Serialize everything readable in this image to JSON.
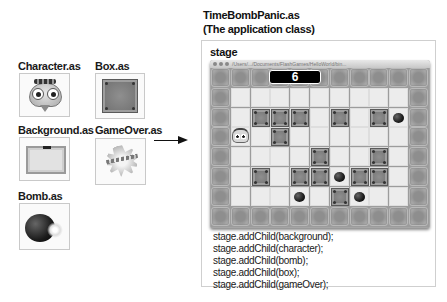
{
  "assets": [
    {
      "label": "Character.as",
      "icon": "character-icon"
    },
    {
      "label": "Box.as",
      "icon": "box-icon"
    },
    {
      "label": "Background.as",
      "icon": "background-icon"
    },
    {
      "label": "GameOver.as",
      "icon": "game-over-icon"
    },
    {
      "label": "Bomb.as",
      "icon": "bomb-icon"
    }
  ],
  "app": {
    "title_line1": "TimeBombPanic.as",
    "title_line2": "(The application class)",
    "stage_label": "stage"
  },
  "game_window": {
    "titlebar_path": "/Users/.../Documents/FlashGames/HelloWorld/bin...",
    "timer_value": "6",
    "grid": {
      "columns": 11,
      "rows": 8,
      "inner_columns": 9,
      "inner_rows": 6,
      "boxes": [
        [
          1,
          1
        ],
        [
          2,
          1
        ],
        [
          3,
          1
        ],
        [
          5,
          1
        ],
        [
          7,
          1
        ],
        [
          2,
          2
        ],
        [
          4,
          3
        ],
        [
          7,
          3
        ],
        [
          1,
          4
        ],
        [
          3,
          4
        ],
        [
          4,
          4
        ],
        [
          6,
          4
        ],
        [
          7,
          4
        ],
        [
          5,
          5
        ]
      ],
      "bombs": [
        [
          8,
          1
        ],
        [
          5,
          4
        ],
        [
          3,
          5
        ],
        [
          6,
          5
        ]
      ],
      "character": [
        0,
        2
      ]
    }
  },
  "code_lines": [
    "stage.addChild(background);",
    "stage.addChild(character);",
    "stage.addChild(bomb);",
    "stage.addChild(box);",
    "stage.addChild(gameOver);"
  ],
  "colors": {
    "wall": "#9c9c9c",
    "floor": "#ececec",
    "box": "#7f7f7f",
    "timer_bg": "#000000",
    "panel_border": "#cfcfcf"
  }
}
